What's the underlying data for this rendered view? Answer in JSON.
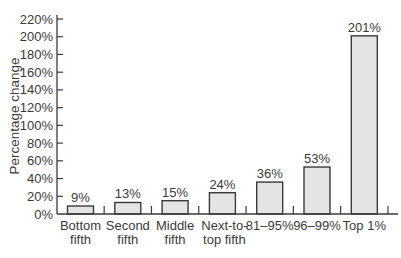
{
  "chart_data": {
    "type": "bar",
    "title": "",
    "xlabel": "",
    "ylabel": "Percentage change",
    "ylim": [
      0,
      220
    ],
    "yticks": [
      0,
      20,
      40,
      60,
      80,
      100,
      120,
      140,
      160,
      180,
      200,
      220
    ],
    "ytick_format": "{v}%",
    "grid": false,
    "legend": "none",
    "categories": [
      [
        "Bottom",
        "fifth"
      ],
      [
        "Second",
        "fifth"
      ],
      [
        "Middle",
        "fifth"
      ],
      [
        "Next-to-",
        "top fifth"
      ],
      [
        "81–95%"
      ],
      [
        "96–99%"
      ],
      [
        "Top 1%"
      ]
    ],
    "values": [
      9,
      13,
      15,
      24,
      36,
      53,
      201
    ],
    "data_labels": [
      "9%",
      "13%",
      "15%",
      "24%",
      "36%",
      "53%",
      "201%"
    ],
    "colors": {
      "bar_fill": "#e4e4e4",
      "bar_stroke": "#3a3a3a",
      "axis": "#3a3a3a"
    }
  }
}
